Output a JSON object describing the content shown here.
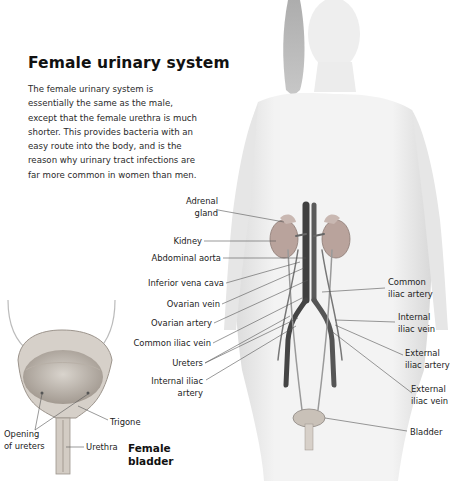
{
  "header": {
    "title": "Female urinary system",
    "intro": "The female urinary system is essentially the same as the male, except that the female urethra is much shorter. This provides bacteria with an easy route into the body, and is the reason why urinary tract infections are far more common in women than men."
  },
  "body_diagram": {
    "labels_left": [
      {
        "id": "adrenal-gland",
        "lines": [
          "Adrenal",
          "gland"
        ]
      },
      {
        "id": "kidney",
        "lines": [
          "Kidney"
        ]
      },
      {
        "id": "abdominal-aorta",
        "lines": [
          "Abdominal aorta"
        ]
      },
      {
        "id": "inferior-vena-cava",
        "lines": [
          "Inferior vena cava"
        ]
      },
      {
        "id": "ovarian-vein",
        "lines": [
          "Ovarian vein"
        ]
      },
      {
        "id": "ovarian-artery",
        "lines": [
          "Ovarian artery"
        ]
      },
      {
        "id": "common-iliac-vein",
        "lines": [
          "Common iliac vein"
        ]
      },
      {
        "id": "ureters",
        "lines": [
          "Ureters"
        ]
      },
      {
        "id": "internal-iliac-artery",
        "lines": [
          "Internal iliac",
          "artery"
        ]
      }
    ],
    "labels_right": [
      {
        "id": "common-iliac-artery",
        "lines": [
          "Common",
          "iliac artery"
        ]
      },
      {
        "id": "internal-iliac-vein",
        "lines": [
          "Internal",
          "iliac vein"
        ]
      },
      {
        "id": "external-iliac-artery",
        "lines": [
          "External",
          "iliac artery"
        ]
      },
      {
        "id": "external-iliac-vein",
        "lines": [
          "External",
          "iliac vein"
        ]
      },
      {
        "id": "bladder",
        "lines": [
          "Bladder"
        ]
      }
    ]
  },
  "bladder_inset": {
    "title_lines": [
      "Female",
      "bladder"
    ],
    "labels": [
      {
        "id": "opening-of-ureters",
        "lines": [
          "Opening",
          "of ureters"
        ]
      },
      {
        "id": "trigone",
        "lines": [
          "Trigone"
        ]
      },
      {
        "id": "urethra",
        "lines": [
          "Urethra"
        ]
      }
    ]
  },
  "colors": {
    "text": "#1a1a1a",
    "leader_line": "#555555",
    "skin": "#ececec",
    "kidney": "#b9a39c",
    "vessel_dark": "#4a4a4a",
    "vessel_mid": "#7a7a7a",
    "bladder_wall": "#cfc9c2"
  }
}
